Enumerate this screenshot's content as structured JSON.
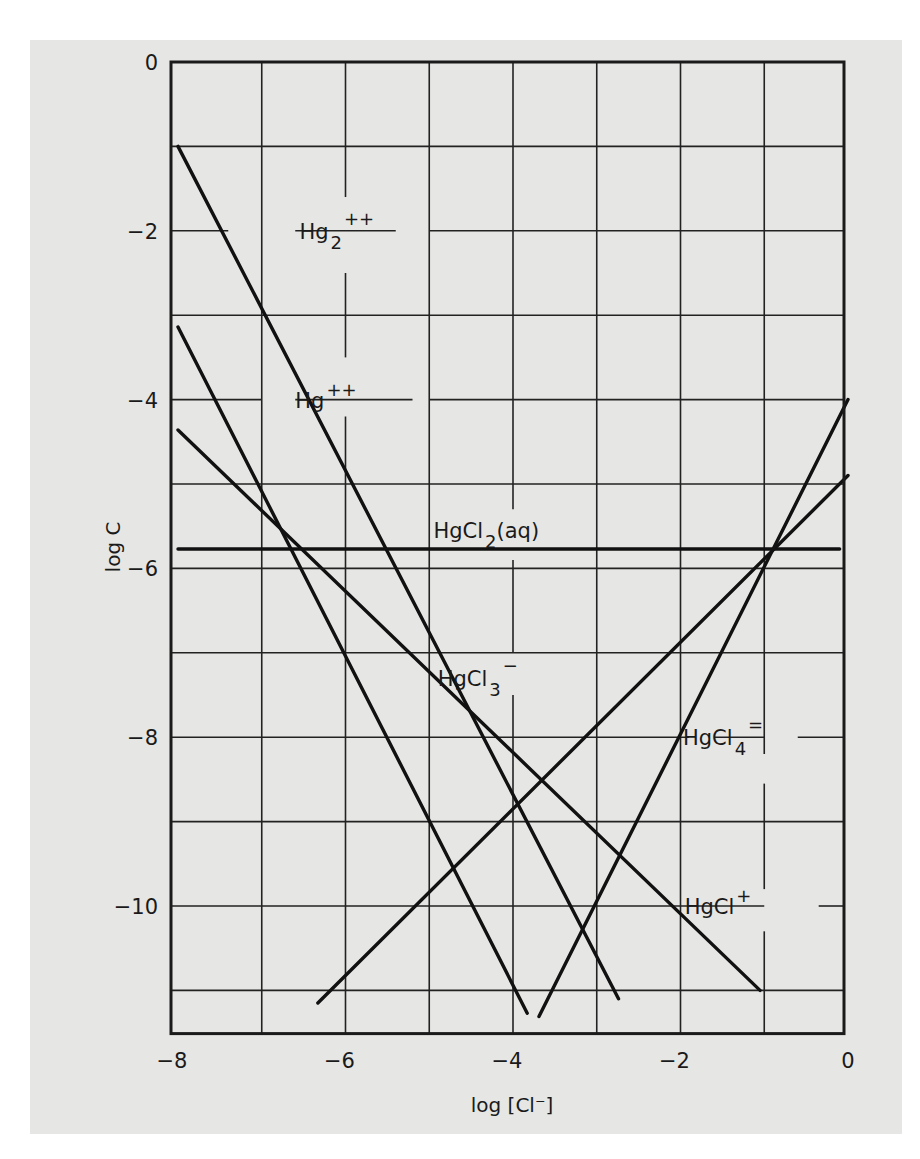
{
  "chart_data": {
    "type": "line",
    "title": "",
    "xlabel": "log [Cl⁻]",
    "ylabel": "log C",
    "xlim": [
      -8,
      0
    ],
    "ylim": [
      -11.5,
      0
    ],
    "grid": true,
    "x_ticks": [
      -8,
      -6,
      -4,
      -2,
      0
    ],
    "x_tick_labels": [
      "−8",
      "−6",
      "−4",
      "−2",
      "0"
    ],
    "y_ticks": [
      0,
      -2,
      -4,
      -6,
      -8,
      -10
    ],
    "y_tick_labels": [
      "0",
      "−2",
      "−4",
      "−6",
      "−8",
      "−10"
    ],
    "x_grid": [
      -7,
      -6,
      -5,
      -4,
      -3,
      -2,
      -1
    ],
    "y_grid": [
      -1,
      -2,
      -3,
      -4,
      -5,
      -6,
      -7,
      -8,
      -9,
      -10,
      -11
    ],
    "series": [
      {
        "name": "Hg2++",
        "label_main": "Hg",
        "label_sub": "2",
        "label_sup": "++",
        "slope": -2,
        "points": [
          [
            -8,
            -1.0
          ],
          [
            -2.74,
            -11.1
          ]
        ],
        "label_at": [
          -6.55,
          -2.0
        ]
      },
      {
        "name": "Hg++",
        "label_main": "Hg",
        "label_sub": "",
        "label_sup": "++",
        "slope": -2,
        "points": [
          [
            -8,
            -3.14
          ],
          [
            -3.83,
            -11.27
          ]
        ],
        "label_at": [
          -6.6,
          -4.0
        ]
      },
      {
        "name": "HgCl+",
        "label_main": "HgCl",
        "label_sub": "",
        "label_sup": "+",
        "slope": -1,
        "points": [
          [
            -8,
            -4.36
          ],
          [
            -1.05,
            -11.0
          ]
        ],
        "label_at": [
          -1.95,
          -10.0
        ]
      },
      {
        "name": "HgCl2(aq)",
        "label_main": "HgCl",
        "label_sub": "2",
        "label_sup": "",
        "label_suffix": "(aq)",
        "slope": 0,
        "points": [
          [
            -8,
            -5.77
          ],
          [
            -0.1,
            -5.77
          ]
        ],
        "label_at": [
          -4.95,
          -5.55
        ]
      },
      {
        "name": "HgCl3-",
        "label_main": "HgCl",
        "label_sub": "3",
        "label_sup": "−",
        "slope": 1,
        "points": [
          [
            -6.33,
            -11.15
          ],
          [
            0,
            -4.9
          ]
        ],
        "label_at": [
          -4.9,
          -7.3
        ]
      },
      {
        "name": "HgCl4=",
        "label_main": "HgCl",
        "label_sub": "4",
        "label_sup": "=",
        "slope": 2,
        "points": [
          [
            -3.69,
            -11.31
          ],
          [
            0,
            -4.0
          ]
        ],
        "label_at": [
          -1.97,
          -8.0
        ]
      }
    ],
    "label_gaps": {
      "h": [
        [
          -2,
          -7.4,
          -6.6
        ],
        [
          -2,
          -5.4,
          -5.0
        ],
        [
          -4,
          -7.0,
          -6.6
        ],
        [
          -4,
          -5.2,
          -5.0
        ],
        [
          -8,
          -1.9,
          -1.6
        ],
        [
          -10,
          -1.0,
          -0.35
        ],
        [
          -8,
          -1.0,
          -0.6
        ]
      ],
      "v": [
        [
          -6,
          -1.6,
          -2.5
        ],
        [
          -6,
          -3.5,
          -4.2
        ],
        [
          -4,
          -5.3,
          -5.9
        ],
        [
          -4,
          -7.0,
          -7.5
        ],
        [
          -1,
          -8.2,
          -8.55
        ],
        [
          -1,
          -9.8,
          -10.3
        ]
      ]
    }
  }
}
